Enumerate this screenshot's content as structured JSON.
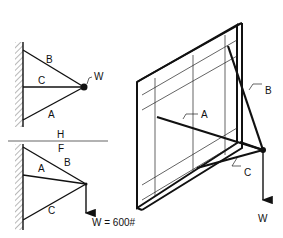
{
  "figure": {
    "top_left_diagram": {
      "members": [
        "B",
        "C",
        "A"
      ],
      "load_label": "W"
    },
    "separator": {
      "label_above": "H",
      "label_below": "F"
    },
    "bottom_left_diagram": {
      "members": [
        "A",
        "B",
        "C"
      ],
      "load_label": "W = 600#"
    },
    "isometric_diagram": {
      "members": [
        "A",
        "B",
        "C"
      ],
      "load_label": "W"
    }
  },
  "colors": {
    "line": "#111111",
    "background": "#ffffff"
  }
}
